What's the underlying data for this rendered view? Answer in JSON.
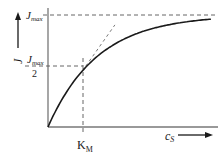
{
  "chart_data": {
    "type": "line",
    "title": "",
    "ylabel": "J",
    "xlabel": "c_S",
    "y_marks": [
      {
        "label_main": "J",
        "label_sub": "max",
        "value_fraction": 1.0
      },
      {
        "label_main": "J",
        "label_sub": "max",
        "label_denominator": "2",
        "value_fraction": 0.5
      }
    ],
    "x_marks": [
      {
        "label_main": "K",
        "label_sub": "M",
        "value_units_of_KM": 1.0
      }
    ],
    "curve": {
      "Jmax": 1.0,
      "KM": 1.0,
      "x_range": [
        0,
        6
      ]
    },
    "tangent_line": "dashed line tangent to the curve at the K_M point",
    "colors": {
      "curve": "#1a1a1a",
      "axis": "#777777",
      "dashed": "#555555"
    }
  },
  "labels": {
    "y_axis": "J",
    "x_axis_main": "c",
    "x_axis_sub": "S",
    "jmax_main": "J",
    "jmax_sub": "max",
    "jhalf_main": "J",
    "jhalf_sub": "max",
    "jhalf_den": "2",
    "km_main": "K",
    "km_sub": "M"
  }
}
